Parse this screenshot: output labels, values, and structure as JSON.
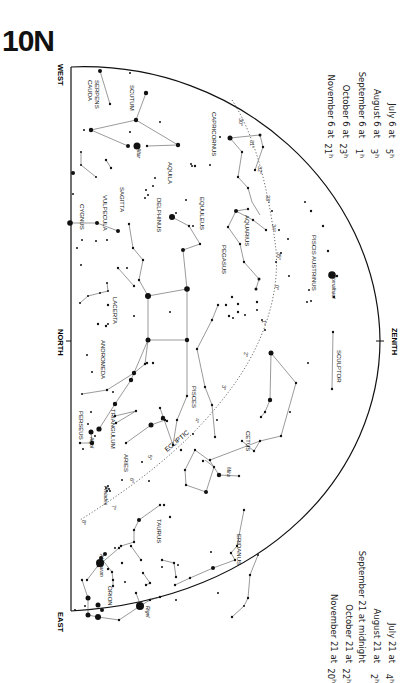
{
  "title": "10N",
  "directions": {
    "west": "WEST",
    "north": "NORTH",
    "east": "EAST",
    "zenith": "ZENITH"
  },
  "times_top": [
    {
      "label": "July 6 at",
      "hour": "5",
      "unit": "h"
    },
    {
      "label": "August 6 at",
      "hour": "3",
      "unit": "h"
    },
    {
      "label": "September 6 at",
      "hour": "1",
      "unit": "h"
    },
    {
      "label": "October 6 at",
      "hour": "23",
      "unit": "h"
    },
    {
      "label": "November 6 at",
      "hour": "21",
      "unit": "h"
    }
  ],
  "times_bottom": [
    {
      "label": "July 21 at",
      "hour": "4",
      "unit": "h"
    },
    {
      "label": "August 21 at",
      "hour": "2",
      "unit": "h"
    },
    {
      "label": "September 21 at midnight",
      "hour": "",
      "unit": ""
    },
    {
      "label": "October 21 at",
      "hour": "22",
      "unit": "h"
    },
    {
      "label": "November 21 at",
      "hour": "20",
      "unit": "h"
    }
  ],
  "constellations": [
    {
      "name": "SERPENS CAUDA",
      "x": 95,
      "y": 80
    },
    {
      "name": "SCUTUM",
      "x": 130,
      "y": 85
    },
    {
      "name": "CAPRICORNUS",
      "x": 212,
      "y": 112
    },
    {
      "name": "AQUILA",
      "x": 168,
      "y": 162
    },
    {
      "name": "SAGITTA",
      "x": 120,
      "y": 187
    },
    {
      "name": "VULPECULA",
      "x": 103,
      "y": 195
    },
    {
      "name": "CYGNUS",
      "x": 80,
      "y": 204
    },
    {
      "name": "DELPHINUS",
      "x": 157,
      "y": 198
    },
    {
      "name": "EQUULEUS",
      "x": 200,
      "y": 197
    },
    {
      "name": "AQUARIUS",
      "x": 245,
      "y": 215
    },
    {
      "name": "PISCIS AUSTRINUS",
      "x": 312,
      "y": 235
    },
    {
      "name": "PEGASUS",
      "x": 222,
      "y": 245
    },
    {
      "name": "LACERTA",
      "x": 113,
      "y": 297
    },
    {
      "name": "ANDROMEDA",
      "x": 101,
      "y": 340
    },
    {
      "name": "SCULPTOR",
      "x": 337,
      "y": 350
    },
    {
      "name": "PISCES",
      "x": 192,
      "y": 386
    },
    {
      "name": "CETUS",
      "x": 246,
      "y": 431
    },
    {
      "name": "PERSEUS",
      "x": 79,
      "y": 411
    },
    {
      "name": "TRIANGULUM",
      "x": 111,
      "y": 409
    },
    {
      "name": "ARIES",
      "x": 124,
      "y": 454
    },
    {
      "name": "ERIDANUS",
      "x": 237,
      "y": 534
    },
    {
      "name": "TAURUS",
      "x": 157,
      "y": 519
    },
    {
      "name": "ORION",
      "x": 108,
      "y": 586
    }
  ],
  "stars_named": [
    {
      "name": "Altar",
      "x": 137,
      "y": 148
    },
    {
      "name": "Fomalhaut",
      "x": 332,
      "y": 275
    },
    {
      "name": "Algol",
      "x": 90,
      "y": 437
    },
    {
      "name": "Mira",
      "x": 227,
      "y": 467
    },
    {
      "name": "Pleiades",
      "x": 104,
      "y": 486
    },
    {
      "name": "Aldebaran",
      "x": 100,
      "y": 554
    },
    {
      "name": "Rigel",
      "x": 146,
      "y": 606
    }
  ],
  "ecliptic": {
    "label": "ECLIPTIC",
    "marks": [
      "30°",
      "31°",
      "32°",
      "33°",
      "34°",
      "35°",
      "0°",
      "1°",
      "2°",
      "3°",
      "4°",
      "5°"
    ]
  },
  "colors": {
    "ink": "#111111",
    "line": "#555555",
    "background": "#ffffff"
  }
}
